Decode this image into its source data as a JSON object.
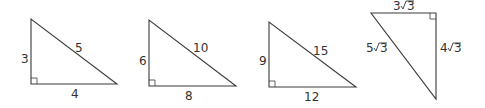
{
  "triangles": [
    {
      "id": "t1",
      "leg_vertical": "3",
      "leg_horizontal": "4",
      "hypotenuse": "5"
    },
    {
      "id": "t2",
      "leg_vertical": "6",
      "leg_horizontal": "8",
      "hypotenuse": "10"
    },
    {
      "id": "t3",
      "leg_vertical": "9",
      "leg_horizontal": "12",
      "hypotenuse": "15"
    },
    {
      "id": "t4",
      "leg_horizontal_coef": "3",
      "leg_vertical_coef": "4",
      "hypotenuse_coef": "5",
      "radicand": "3"
    }
  ],
  "colors": {
    "stroke": "#3a3a3a",
    "text": "#333333",
    "background": "#ffffff"
  }
}
